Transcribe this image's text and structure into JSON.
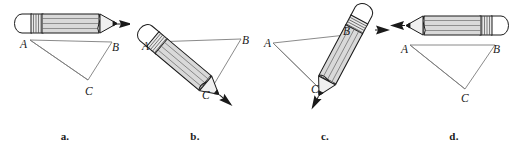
{
  "figure": {
    "background_color": "#ffffff",
    "line_color": "#555555",
    "ink_color": "#1a1a1a",
    "pencil_body_color": "#d9d9d9",
    "pencil_core_color": "#c8c8c8",
    "eraser_color": "#ffffff",
    "ferrule_color": "#e6e6e6",
    "width": 518,
    "height": 145
  },
  "panels": [
    {
      "id": "a",
      "caption": "a.",
      "pencil": {
        "name": "pencil-horizontal-right",
        "orientation_deg": 0,
        "tip_direction": "right",
        "eraser_side": "left",
        "has_tip_arrow": true
      },
      "vertices": [
        {
          "label": "A",
          "x": 30,
          "y": 41
        },
        {
          "label": "B",
          "x": 113,
          "y": 43
        },
        {
          "label": "C",
          "x": 89,
          "y": 82
        }
      ]
    },
    {
      "id": "b",
      "caption": "b.",
      "pencil": {
        "name": "pencil-rotated-down-right",
        "orientation_deg": 40,
        "tip_direction": "down-right",
        "eraser_side": "upper-left",
        "has_tip_arrow": true
      },
      "vertices": [
        {
          "label": "A",
          "x": 150,
          "y": 45
        },
        {
          "label": "B",
          "x": 242,
          "y": 41
        },
        {
          "label": "C",
          "x": 209,
          "y": 93
        }
      ]
    },
    {
      "id": "c",
      "caption": "c.",
      "pencil": {
        "name": "pencil-rotated-down-left",
        "orientation_deg": 115,
        "tip_direction": "down-left",
        "eraser_side": "upper-right",
        "has_tip_arrow": true
      },
      "vertices": [
        {
          "label": "A",
          "x": 271,
          "y": 44
        },
        {
          "label": "B",
          "x": 345,
          "y": 37
        },
        {
          "label": "C",
          "x": 320,
          "y": 90
        }
      ]
    },
    {
      "id": "d",
      "caption": "d.",
      "pencil": {
        "name": "pencil-horizontal-left",
        "orientation_deg": 180,
        "tip_direction": "left",
        "eraser_side": "right",
        "has_tip_arrow": true
      },
      "vertices": [
        {
          "label": "A",
          "x": 410,
          "y": 47
        },
        {
          "label": "B",
          "x": 495,
          "y": 47
        },
        {
          "label": "C",
          "x": 465,
          "y": 91
        }
      ]
    }
  ]
}
